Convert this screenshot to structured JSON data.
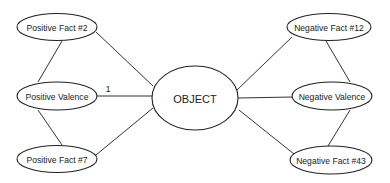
{
  "diagram": {
    "center": {
      "id": "object",
      "label": "OBJECT",
      "cx": 195,
      "cy": 98,
      "rx": 43,
      "ry": 32
    },
    "nodes": [
      {
        "id": "pos-fact-2",
        "label": "Positive Fact #2",
        "cx": 57,
        "cy": 27,
        "rx": 40,
        "ry": 13.5
      },
      {
        "id": "pos-valence",
        "label": "Positive Valence",
        "cx": 57,
        "cy": 96,
        "rx": 40,
        "ry": 14
      },
      {
        "id": "pos-fact-7",
        "label": "Positive Fact #7",
        "cx": 57,
        "cy": 159,
        "rx": 40,
        "ry": 13.5
      },
      {
        "id": "neg-fact-12",
        "label": "Negative Fact #12",
        "cx": 329,
        "cy": 27,
        "rx": 42,
        "ry": 13.5
      },
      {
        "id": "neg-valence",
        "label": "Negative Valence",
        "cx": 332,
        "cy": 96,
        "rx": 40,
        "ry": 14
      },
      {
        "id": "neg-fact-43",
        "label": "Negative Fact #43",
        "cx": 331,
        "cy": 160,
        "rx": 41,
        "ry": 14
      }
    ],
    "edges": [
      {
        "from": "pos-fact-2",
        "to": "pos-valence",
        "x1": 62,
        "y1": 41,
        "x2": 38,
        "y2": 82
      },
      {
        "from": "pos-fact-2",
        "to": "object",
        "x1": 96,
        "y1": 32,
        "x2": 153,
        "y2": 86
      },
      {
        "from": "pos-valence",
        "to": "object",
        "x1": 97,
        "y1": 96,
        "x2": 152,
        "y2": 96,
        "label": "1"
      },
      {
        "from": "pos-valence",
        "to": "pos-fact-7",
        "x1": 38,
        "y1": 110,
        "x2": 62,
        "y2": 145
      },
      {
        "from": "pos-fact-7",
        "to": "object",
        "x1": 96,
        "y1": 155,
        "x2": 153,
        "y2": 108
      },
      {
        "from": "neg-fact-12",
        "to": "object",
        "x1": 292,
        "y1": 37,
        "x2": 237,
        "y2": 90
      },
      {
        "from": "neg-fact-12",
        "to": "neg-valence",
        "x1": 326,
        "y1": 41,
        "x2": 350,
        "y2": 82
      },
      {
        "from": "object",
        "to": "neg-valence",
        "x1": 238,
        "y1": 98,
        "x2": 292,
        "y2": 97
      },
      {
        "from": "neg-valence",
        "to": "neg-fact-43",
        "x1": 350,
        "y1": 110,
        "x2": 328,
        "y2": 146
      },
      {
        "from": "object",
        "to": "neg-fact-43",
        "x1": 239,
        "y1": 110,
        "x2": 294,
        "y2": 154
      }
    ],
    "edge_label": {
      "text": "1",
      "x": 108,
      "y": 92
    }
  }
}
